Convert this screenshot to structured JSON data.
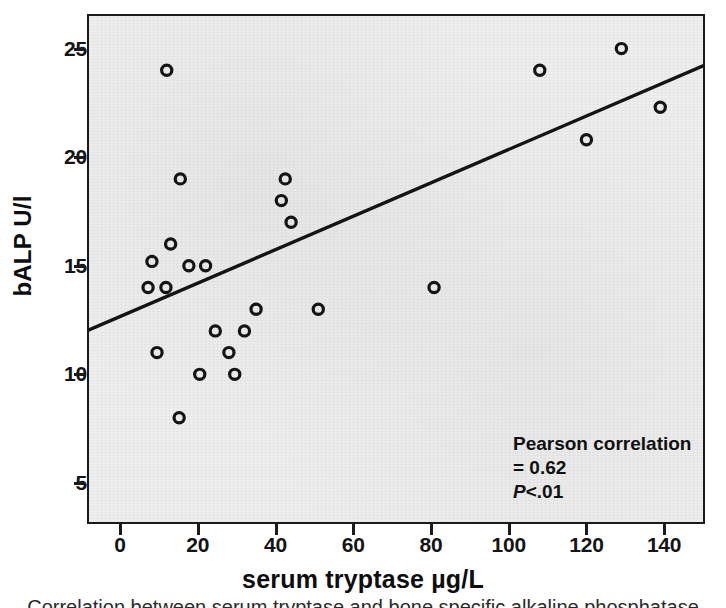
{
  "chart_data": {
    "type": "scatter",
    "title": "",
    "xlabel": "serum tryptase µg/L",
    "ylabel": "bALP U/l",
    "xlim": [
      -8,
      150
    ],
    "ylim": [
      3.2,
      26.5
    ],
    "xticks": [
      0,
      20,
      40,
      60,
      80,
      100,
      120,
      140
    ],
    "yticks": [
      5,
      10,
      15,
      20,
      25
    ],
    "grid": false,
    "legend": null,
    "marker": "open-circle",
    "points": [
      {
        "x": 12,
        "y": 24.0
      },
      {
        "x": 13,
        "y": 16.0
      },
      {
        "x": 8.2,
        "y": 15.2
      },
      {
        "x": 17.7,
        "y": 15.0
      },
      {
        "x": 22,
        "y": 15.0
      },
      {
        "x": 7.2,
        "y": 14.0
      },
      {
        "x": 11.8,
        "y": 14.0
      },
      {
        "x": 15.5,
        "y": 19.0
      },
      {
        "x": 9.5,
        "y": 11.0
      },
      {
        "x": 15.2,
        "y": 8.0
      },
      {
        "x": 20.5,
        "y": 10.0
      },
      {
        "x": 24.5,
        "y": 12.0
      },
      {
        "x": 28,
        "y": 11.0
      },
      {
        "x": 29.5,
        "y": 10.0
      },
      {
        "x": 32,
        "y": 12.0
      },
      {
        "x": 35,
        "y": 13.0
      },
      {
        "x": 41.5,
        "y": 18.0
      },
      {
        "x": 42.5,
        "y": 19.0
      },
      {
        "x": 44,
        "y": 17.0
      },
      {
        "x": 51,
        "y": 13.0
      },
      {
        "x": 80.8,
        "y": 14.0
      },
      {
        "x": 108,
        "y": 24.0
      },
      {
        "x": 120,
        "y": 20.8
      },
      {
        "x": 129,
        "y": 25.0
      },
      {
        "x": 139,
        "y": 22.3
      }
    ],
    "fit_line": {
      "label": "linear fit",
      "x_start": -8,
      "y_start": 12.05,
      "x_end": 150,
      "y_end": 24.2
    },
    "annotations": [
      {
        "text": "Pearson correlation = 0.62"
      },
      {
        "p_prefix": "P",
        "p_rest": "<.01"
      }
    ]
  },
  "axes": {
    "y_title": "bALP U/l",
    "x_title": "serum tryptase µg/L",
    "y_tick_labels": [
      "25",
      "20",
      "15",
      "10",
      "5"
    ],
    "x_tick_labels": [
      "0",
      "20",
      "40",
      "60",
      "80",
      "100",
      "120",
      "140"
    ]
  },
  "annotation": {
    "pearson": "Pearson correlation = 0.62",
    "p_italic": "P",
    "p_value": "<.01"
  },
  "caption": {
    "sliver_text": "Correlation between serum tryptase and bone specific alkaline phosphatase"
  },
  "colors": {
    "panel_background": "#efefef",
    "page_background": "#ffffff",
    "frame": "#1b1b1b",
    "marker": "#141414",
    "fit_line": "#141414",
    "text": "#111111"
  }
}
